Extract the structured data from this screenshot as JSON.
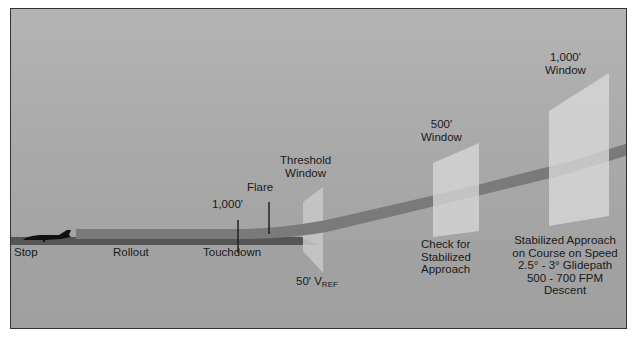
{
  "diagram": {
    "colors": {
      "sky_top": "#b4b4b4",
      "ground": "#a2a2a2",
      "runway": "#555555",
      "glidepath": "#7a7a7a",
      "glidepath_in_window": "#9a9a9a",
      "window_panel": "#d4d4d4",
      "frame": "#333333",
      "aircraft": "#111111"
    },
    "labels": {
      "stop": "Stop",
      "rollout": "Rollout",
      "touchdown": "Touchdown",
      "touchdown_distance": "1,000'",
      "flare": "Flare",
      "threshold_window_line1": "Threshold",
      "threshold_window_line2": "Window",
      "vref_prefix": "50' V",
      "vref_subscript": "REF",
      "window_500_line1": "500'",
      "window_500_line2": "Window",
      "check_line1": "Check for",
      "check_line2": "Stabilized",
      "check_line3": "Approach",
      "window_1000_line1": "1,000'",
      "window_1000_line2": "Window",
      "stabilized_line1": "Stabilized Approach",
      "stabilized_line2": "on Course on Speed",
      "stabilized_line3": "2.5° - 3° Glidepath",
      "stabilized_line4": "500 - 700 FPM",
      "stabilized_line5": "Descent"
    },
    "icons": {
      "aircraft": "jet-aircraft-silhouette"
    }
  }
}
